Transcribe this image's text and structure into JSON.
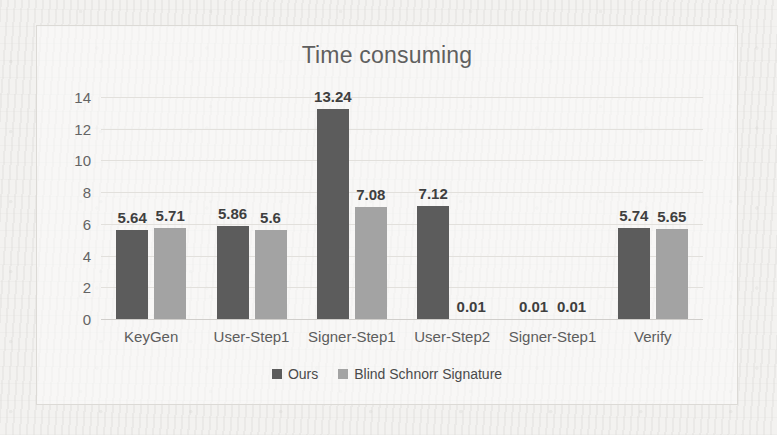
{
  "chart_data": {
    "type": "bar",
    "title": "Time consuming",
    "xlabel": "",
    "ylabel": "",
    "ylim": [
      0,
      14
    ],
    "yticks": [
      0,
      2,
      4,
      6,
      8,
      10,
      12,
      14
    ],
    "grid": true,
    "legend_position": "bottom",
    "categories": [
      "KeyGen",
      "User-Step1",
      "Signer-Step1",
      "User-Step2",
      "Signer-Step1",
      "Verify"
    ],
    "series": [
      {
        "name": "Ours",
        "color": "#5c5c5c",
        "values": [
          5.64,
          5.86,
          13.24,
          7.12,
          0.01,
          5.74
        ],
        "labels": [
          "5.64",
          "5.86",
          "13.24",
          "7.12",
          "0.01",
          "5.74"
        ]
      },
      {
        "name": "Blind Schnorr Signature",
        "color": "#a3a3a3",
        "values": [
          5.71,
          5.6,
          7.08,
          0.01,
          0.01,
          5.65
        ],
        "labels": [
          "5.71",
          "5.6",
          "7.08",
          "0.01",
          "0.01",
          "5.65"
        ]
      }
    ]
  },
  "chart": {
    "title": "Time consuming"
  }
}
